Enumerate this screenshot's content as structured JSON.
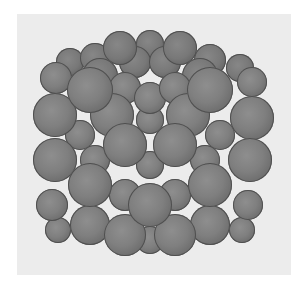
{
  "figure": {
    "panel_color": "#ececec",
    "background_color": "#ffffff",
    "sphere_color": "#7f7f7f"
  },
  "atoms": [
    {
      "x": 120,
      "y": 48,
      "r": 17,
      "layer": "back"
    },
    {
      "x": 150,
      "y": 44,
      "r": 14,
      "layer": "back"
    },
    {
      "x": 180,
      "y": 48,
      "r": 17,
      "layer": "back"
    },
    {
      "x": 95,
      "y": 58,
      "r": 15,
      "layer": "back"
    },
    {
      "x": 210,
      "y": 60,
      "r": 16,
      "layer": "back"
    },
    {
      "x": 240,
      "y": 68,
      "r": 14,
      "layer": "back"
    },
    {
      "x": 70,
      "y": 62,
      "r": 14,
      "layer": "back"
    },
    {
      "x": 135,
      "y": 62,
      "r": 16,
      "layer": "back"
    },
    {
      "x": 165,
      "y": 62,
      "r": 16,
      "layer": "back"
    },
    {
      "x": 100,
      "y": 76,
      "r": 18,
      "layer": "back"
    },
    {
      "x": 200,
      "y": 76,
      "r": 18,
      "layer": "back"
    },
    {
      "x": 56,
      "y": 78,
      "r": 16,
      "layer": "front"
    },
    {
      "x": 90,
      "y": 90,
      "r": 23,
      "layer": "front"
    },
    {
      "x": 125,
      "y": 88,
      "r": 16,
      "layer": "front"
    },
    {
      "x": 150,
      "y": 98,
      "r": 16,
      "layer": "front"
    },
    {
      "x": 175,
      "y": 88,
      "r": 16,
      "layer": "front"
    },
    {
      "x": 210,
      "y": 90,
      "r": 23,
      "layer": "front"
    },
    {
      "x": 252,
      "y": 82,
      "r": 15,
      "layer": "front"
    },
    {
      "x": 55,
      "y": 115,
      "r": 22,
      "layer": "front"
    },
    {
      "x": 112,
      "y": 115,
      "r": 22,
      "layer": "front"
    },
    {
      "x": 188,
      "y": 115,
      "r": 22,
      "layer": "front"
    },
    {
      "x": 252,
      "y": 118,
      "r": 22,
      "layer": "front"
    },
    {
      "x": 150,
      "y": 120,
      "r": 14,
      "layer": "front"
    },
    {
      "x": 80,
      "y": 135,
      "r": 15,
      "layer": "front"
    },
    {
      "x": 220,
      "y": 135,
      "r": 15,
      "layer": "front"
    },
    {
      "x": 125,
      "y": 145,
      "r": 22,
      "layer": "front"
    },
    {
      "x": 175,
      "y": 145,
      "r": 22,
      "layer": "front"
    },
    {
      "x": 150,
      "y": 165,
      "r": 14,
      "layer": "front"
    },
    {
      "x": 55,
      "y": 160,
      "r": 22,
      "layer": "front"
    },
    {
      "x": 95,
      "y": 160,
      "r": 15,
      "layer": "front"
    },
    {
      "x": 205,
      "y": 160,
      "r": 15,
      "layer": "front"
    },
    {
      "x": 250,
      "y": 160,
      "r": 22,
      "layer": "front"
    },
    {
      "x": 90,
      "y": 185,
      "r": 22,
      "layer": "front"
    },
    {
      "x": 210,
      "y": 185,
      "r": 22,
      "layer": "front"
    },
    {
      "x": 125,
      "y": 195,
      "r": 16,
      "layer": "front"
    },
    {
      "x": 175,
      "y": 195,
      "r": 16,
      "layer": "front"
    },
    {
      "x": 150,
      "y": 205,
      "r": 22,
      "layer": "front"
    },
    {
      "x": 52,
      "y": 205,
      "r": 16,
      "layer": "front"
    },
    {
      "x": 248,
      "y": 205,
      "r": 15,
      "layer": "front"
    },
    {
      "x": 90,
      "y": 225,
      "r": 20,
      "layer": "front"
    },
    {
      "x": 210,
      "y": 225,
      "r": 20,
      "layer": "front"
    },
    {
      "x": 125,
      "y": 235,
      "r": 21,
      "layer": "front"
    },
    {
      "x": 175,
      "y": 235,
      "r": 21,
      "layer": "front"
    },
    {
      "x": 150,
      "y": 240,
      "r": 14,
      "layer": "front"
    },
    {
      "x": 58,
      "y": 230,
      "r": 13,
      "layer": "front"
    },
    {
      "x": 242,
      "y": 230,
      "r": 13,
      "layer": "front"
    }
  ]
}
